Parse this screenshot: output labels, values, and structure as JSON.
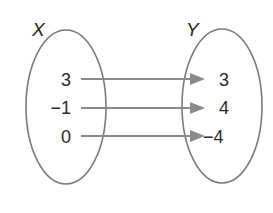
{
  "diagram": {
    "type": "mapping",
    "domain_set": {
      "label": "X",
      "values": [
        "3",
        "−1",
        "0"
      ]
    },
    "range_set": {
      "label": "Y",
      "values": [
        "3",
        "4",
        "−4"
      ]
    },
    "mappings": [
      {
        "from": "3",
        "to": "3"
      },
      {
        "from": "−1",
        "to": "4"
      },
      {
        "from": "0",
        "to": "−4"
      }
    ],
    "colors": {
      "oval_stroke": "#7a7a7a",
      "arrow": "#8a8a8a",
      "text": "#2a2a2a"
    }
  }
}
